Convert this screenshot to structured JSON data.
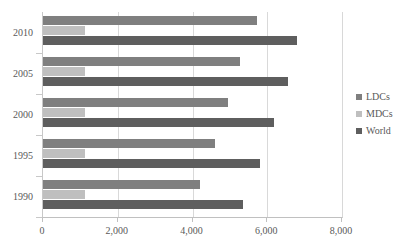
{
  "chart_data": {
    "type": "bar",
    "orientation": "horizontal",
    "title": "",
    "xlabel": "",
    "ylabel": "",
    "categories": [
      "1990",
      "1995",
      "2000",
      "2005",
      "2010"
    ],
    "category_order_top_to_bottom": [
      "2010",
      "2005",
      "2000",
      "1995",
      "1990"
    ],
    "series": [
      {
        "name": "LDCs",
        "color": "#7f7f7f",
        "values": [
          4200,
          4600,
          4950,
          5270,
          5720
        ]
      },
      {
        "name": "MDCs",
        "color": "#bfbfbf",
        "values": [
          1120,
          1120,
          1120,
          1120,
          1120
        ]
      },
      {
        "name": "World",
        "color": "#5e5e5e",
        "values": [
          5360,
          5800,
          6180,
          6550,
          6790
        ]
      }
    ],
    "xlim": [
      0,
      8000
    ],
    "xticks": [
      0,
      2000,
      4000,
      6000,
      8000
    ],
    "xtick_labels": [
      "0",
      "2,000",
      "4,000",
      "6,000",
      "8,000"
    ],
    "grid": true,
    "grid_axis": "x",
    "legend_position": "right"
  },
  "legend": {
    "items": [
      {
        "label": "LDCs"
      },
      {
        "label": "MDCs"
      },
      {
        "label": "World"
      }
    ]
  }
}
